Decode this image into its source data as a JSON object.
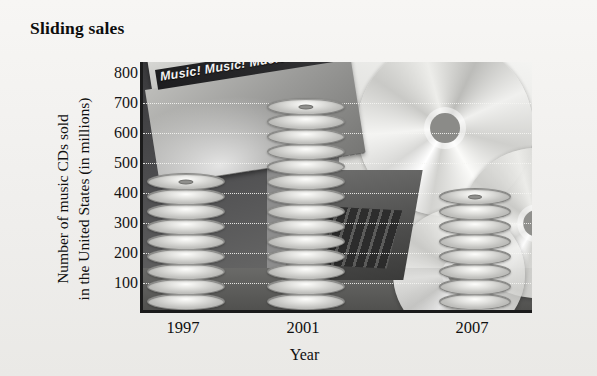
{
  "chart_data": {
    "type": "bar",
    "title": "Sliding sales",
    "xlabel": "Year",
    "ylabel_line1": "Number of music CDs sold",
    "ylabel_line2": "in the United States (in millions)",
    "categories": [
      "1997",
      "2001",
      "2007"
    ],
    "values": [
      450,
      700,
      400
    ],
    "yticks": [
      100,
      200,
      300,
      400,
      500,
      600,
      700,
      800
    ],
    "ytick_labels": [
      "100",
      "200",
      "300",
      "400",
      "500",
      "600",
      "700",
      "800"
    ],
    "ylim": [
      0,
      850
    ],
    "grid": true,
    "legend": "none",
    "pictorial": "bars rendered as stacks of compact discs over a photographic background of CDs, a CD case and a laptop"
  },
  "figure": {
    "title": "Sliding sales",
    "axis_title_x": "Year",
    "axis_title_y_line1": "Number of music CDs sold",
    "axis_title_y_line2": "in the United States (in millions)",
    "background_case_text": "Music! Music! Music!",
    "colors": {
      "page_background": "#f2f1ef",
      "axis": "#1b1b1b",
      "gridline": "#f6f6f3",
      "text": "#101010",
      "disc_light": "#fdfdfb",
      "disc_dark": "#a6a6a3"
    }
  }
}
